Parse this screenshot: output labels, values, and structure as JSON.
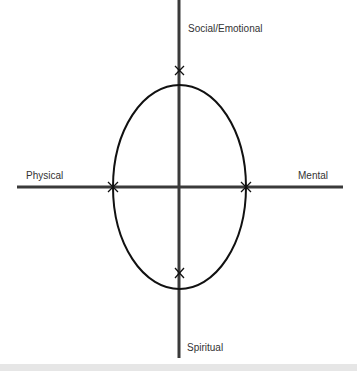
{
  "diagram": {
    "title": "",
    "labels": {
      "top": "Social/Emotional",
      "left": "Physical",
      "right": "Mental",
      "bottom": "Spiritual"
    },
    "colors": {
      "axis": "#3a3a3a",
      "ellipse": "#111111",
      "text": "#333333",
      "footer_band": "#e6e6e6"
    }
  }
}
